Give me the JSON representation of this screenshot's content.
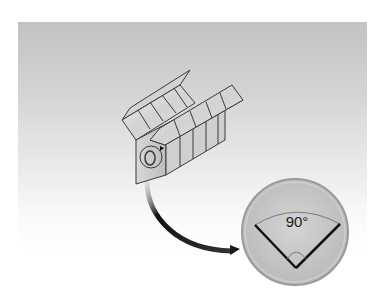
{
  "figure": {
    "inset": {
      "angle_label": "90°",
      "angle_degrees": 90
    }
  },
  "colors": {
    "background_top": "#c2c2c2",
    "background_bottom": "#ffffff",
    "block_face": "#dcdcdc",
    "block_shade": "#bdbdbd",
    "outline": "#3a3a3a",
    "inset_fill": "#c8c8c8",
    "inset_rim": "#9a9a9a",
    "arrow": "#1a1a1a"
  }
}
